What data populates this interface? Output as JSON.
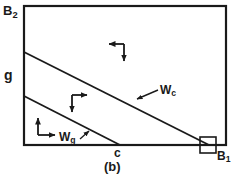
{
  "figure": {
    "caption": "(b)",
    "background_color": "#ffffff",
    "line_color": "#1a1a1a",
    "text_color": "#1a1a1a"
  },
  "axes": {
    "y_axis_label": "B",
    "y_axis_label_sub": "2",
    "x_axis_label": "B",
    "x_axis_label_sub": "1",
    "left_tick_label": "g",
    "bottom_tick_label": "c"
  },
  "curves": [
    {
      "name": "W_c",
      "label": "W",
      "label_sub": "c",
      "description": "upper boundary line from g-region on left axis to B1 corner",
      "x1": 24,
      "y1": 52,
      "x2": 208,
      "y2": 145
    },
    {
      "name": "W_g",
      "label": "W",
      "label_sub": "g",
      "description": "lower boundary line from left axis to point c on bottom axis",
      "x1": 24,
      "y1": 96,
      "x2": 119,
      "y2": 145
    }
  ],
  "arrow_markers": [
    {
      "name": "arrow-upper-region",
      "directions": "left-down",
      "corner_x": 124,
      "corner_y": 44
    },
    {
      "name": "arrow-middle-region",
      "directions": "right-down",
      "corner_x": 72,
      "corner_y": 95
    },
    {
      "name": "arrow-lower-region",
      "directions": "up-right",
      "corner_x": 38,
      "corner_y": 135
    }
  ],
  "highlight_box": {
    "name": "corner-highlight-square",
    "x": 200,
    "y": 137,
    "width": 16,
    "height": 16
  },
  "frame": {
    "x": 24,
    "y": 6,
    "width": 202,
    "height": 139
  }
}
